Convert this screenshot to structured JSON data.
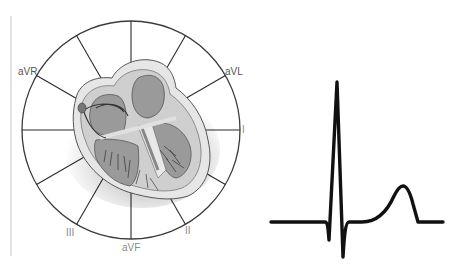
{
  "diagram": {
    "hexaxial": {
      "center": [
        131,
        130
      ],
      "radius": 109,
      "spoke_count": 12,
      "spoke_angles_deg": [
        0,
        30,
        60,
        90,
        120,
        150,
        180,
        210,
        240,
        270,
        300,
        330
      ],
      "leads": [
        {
          "name": "aVR",
          "angle_deg": -150
        },
        {
          "name": "aVL",
          "angle_deg": -30
        },
        {
          "name": "I",
          "angle_deg": 0
        },
        {
          "name": "II",
          "angle_deg": 60
        },
        {
          "name": "aVF",
          "angle_deg": 90
        },
        {
          "name": "III",
          "angle_deg": 120
        }
      ]
    },
    "labels": {
      "avr": "aVR",
      "avl": "aVL",
      "i": "I",
      "ii": "II",
      "avf": "aVF",
      "iii": "III"
    },
    "heart_illustration": "heart-cross-section",
    "ecg": {
      "waves": [
        "Q",
        "R",
        "S",
        "ST",
        "T"
      ],
      "baseline_y": 222,
      "r_peak": [
        337,
        82
      ],
      "q_trough": [
        329,
        240
      ],
      "s_trough": [
        343,
        257
      ],
      "t_peak": [
        402,
        186
      ]
    },
    "colors": {
      "line": "#1a1a1a",
      "circle": "#3a3a3a",
      "heart_fill": "#9a9a9a",
      "heart_light": "#d8d8d8",
      "label": "#555555"
    }
  }
}
